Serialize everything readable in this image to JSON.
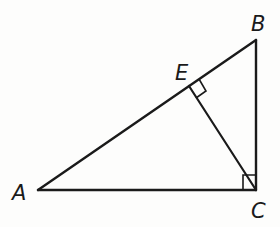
{
  "diagram": {
    "type": "geometry",
    "stroke_color": "#1a1a1a",
    "points": {
      "A": {
        "label": "A",
        "x": 38,
        "y": 190
      },
      "B": {
        "label": "B",
        "x": 256,
        "y": 40
      },
      "C": {
        "label": "C",
        "x": 256,
        "y": 190
      },
      "E": {
        "label": "E",
        "x": 189,
        "y": 86
      }
    },
    "segments": [
      "AB",
      "BC",
      "AC",
      "CE"
    ],
    "right_angles": [
      "ACB",
      "CEB"
    ]
  }
}
